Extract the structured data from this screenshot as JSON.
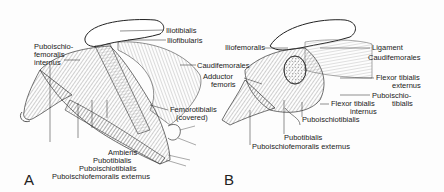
{
  "figure": {
    "panels": [
      {
        "id": "A",
        "label": "A",
        "labels": {
          "puboischiofemoralis_internus_1": "Puboischio-",
          "puboischiofemoralis_internus_2": "femoralis",
          "puboischiofemoralis_internus_3": "internus",
          "iliotibialis": "Iliotibialis",
          "iliofibularis": "Iliofibularis",
          "caudifemorales": "Caudifemorales",
          "femorotibialis_1": "Femorotibialis",
          "femorotibialis_2": "(covered)",
          "ambiens": "Ambiens",
          "pubotibialis": "Pubotibialis",
          "puboischiotibialis": "Puboischiotibialis",
          "puboischiofemoralis_externus": "Puboischiofemoralis externus"
        }
      },
      {
        "id": "B",
        "label": "B",
        "labels": {
          "iliofemoralis": "Iliofemoralis",
          "adductor_femoris_1": "Adductor",
          "adductor_femoris_2": "femoris",
          "ligament": "Ligament",
          "caudifemorales": "Caudifemorales",
          "flexor_tibialis_externus_1": "Flexor tibialis",
          "flexor_tibialis_externus_2": "externus",
          "puboischiotibialis_top_1": "Puboischio-",
          "puboischiotibialis_top_2": "tibialis",
          "flexor_tibialis_internus_1": "Flexor tibialis",
          "flexor_tibialis_internus_2": "internus",
          "puboischiotibialis": "Puboischiotibialis",
          "pubotibialis": "Pubotibialis",
          "puboischiofemoralis_externus": "Puboischiofemoralis externus"
        }
      }
    ]
  }
}
